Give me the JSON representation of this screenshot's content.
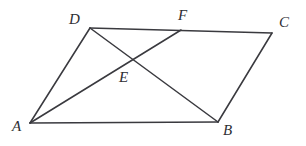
{
  "figure": {
    "kind": "geometry-diagram",
    "shape_name": "parallelogram",
    "background_color": "#ffffff",
    "stroke_color": "#3a3a3f",
    "label_color": "#2e2e33",
    "width": 306,
    "height": 146
  },
  "points": {
    "A": {
      "label": "A",
      "x": 30,
      "y": 123,
      "label_x": 12,
      "label_y": 119
    },
    "B": {
      "label": "B",
      "x": 218,
      "y": 122,
      "label_x": 223,
      "label_y": 123
    },
    "C": {
      "label": "C",
      "x": 272,
      "y": 33,
      "label_x": 279,
      "label_y": 15
    },
    "D": {
      "label": "D",
      "x": 90,
      "y": 28,
      "label_x": 69,
      "label_y": 12
    },
    "E": {
      "label": "E",
      "x": 133,
      "y": 59,
      "label_x": 119,
      "label_y": 70
    },
    "F": {
      "label": "F",
      "x": 181,
      "y": 30,
      "label_x": 178,
      "label_y": 8
    }
  },
  "segments": [
    {
      "name": "segment-AB",
      "from": "A",
      "to": "B"
    },
    {
      "name": "segment-AD",
      "from": "A",
      "to": "D"
    },
    {
      "name": "segment-DC",
      "from": "D",
      "to": "C"
    },
    {
      "name": "segment-BC",
      "from": "B",
      "to": "C"
    },
    {
      "name": "segment-AF",
      "from": "A",
      "to": "F"
    },
    {
      "name": "segment-DB",
      "from": "D",
      "to": "B"
    }
  ]
}
